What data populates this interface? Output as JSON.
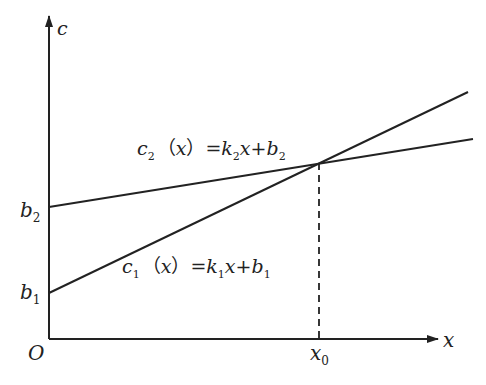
{
  "diagram": {
    "type": "linear cost functions intersection",
    "axes": {
      "y_label": "c",
      "x_label": "x",
      "origin_label": "O"
    },
    "intercepts": {
      "b2": {
        "base": "b",
        "sub": "2"
      },
      "b1": {
        "base": "b",
        "sub": "1"
      }
    },
    "intersection": {
      "base": "x",
      "sub": "0"
    },
    "lines": [
      {
        "name": "c2",
        "label": {
          "c": "c",
          "c_sub": "2",
          "open": "（",
          "x": "x",
          "close": "）",
          "eq": "=",
          "k": "k",
          "k_sub": "2",
          "x2": "x",
          "plus": "+",
          "b": "b",
          "b_sub": "2"
        }
      },
      {
        "name": "c1",
        "label": {
          "c": "c",
          "c_sub": "1",
          "open": "（",
          "x": "x",
          "close": "）",
          "eq": "=",
          "k": "k",
          "k_sub": "1",
          "x2": "x",
          "plus": "+",
          "b": "b",
          "b_sub": "1"
        }
      }
    ]
  },
  "colors": {
    "line": "#222222",
    "background": "#ffffff"
  }
}
